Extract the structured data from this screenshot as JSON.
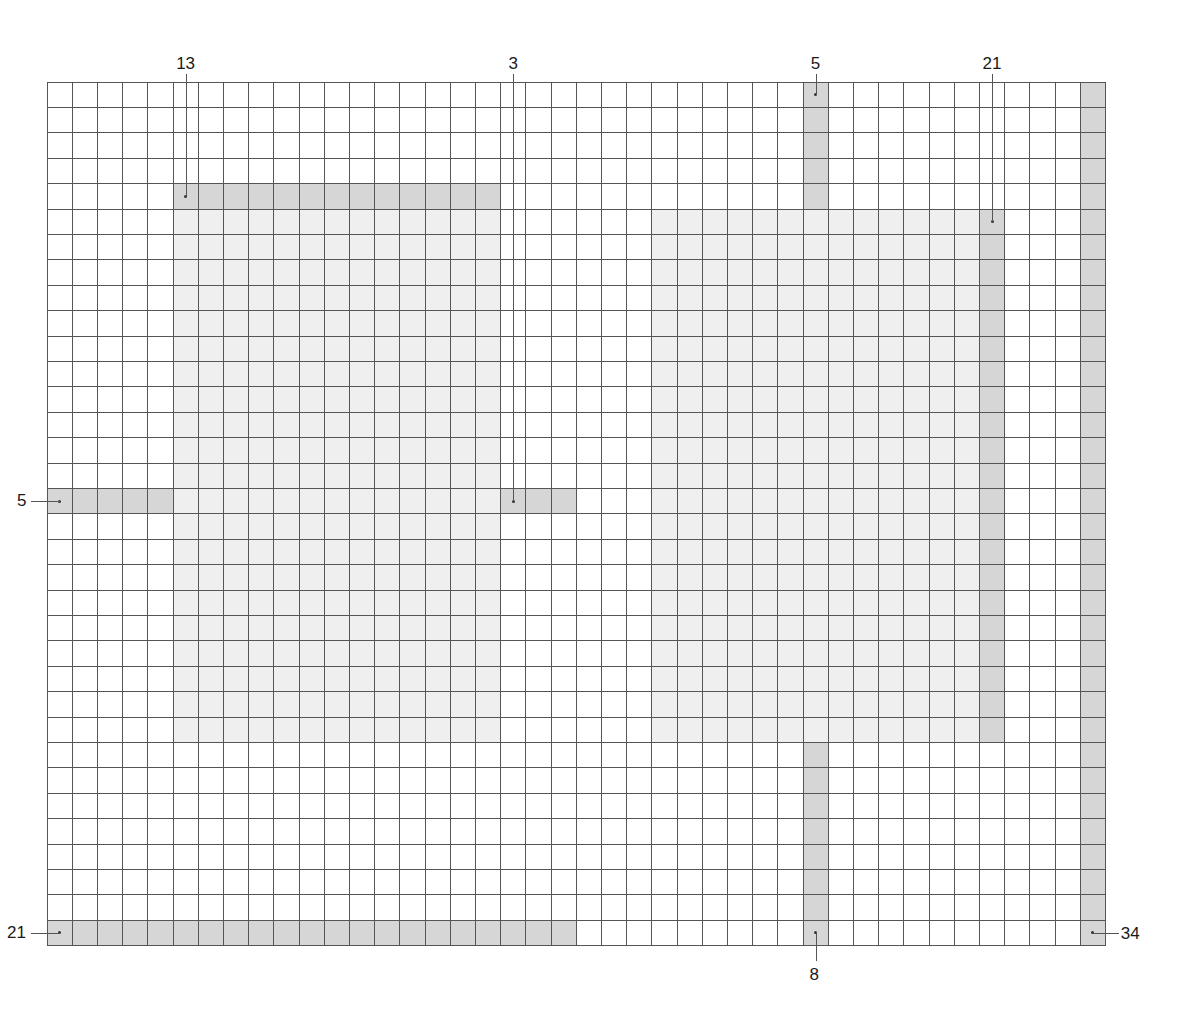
{
  "diagram": {
    "title": "",
    "grid": {
      "cols": 42,
      "rows": 34,
      "origin_x": 47,
      "origin_y": 82,
      "cell_w": 25.2,
      "cell_h": 25.4,
      "divider_col": 21,
      "line_color": "#555555"
    },
    "colors": {
      "light_fill": "#efefef",
      "dark_fill": "#d6d6d6",
      "background": "#ffffff"
    },
    "light_regions": [
      {
        "name": "left-square-region",
        "col": 5,
        "row": 5,
        "w": 13,
        "h": 21
      },
      {
        "name": "right-square-region",
        "col": 24,
        "row": 5,
        "w": 13,
        "h": 21
      }
    ],
    "strips": [
      {
        "name": "strip-13",
        "col": 5,
        "row": 4,
        "w": 13,
        "h": 1,
        "label": "13",
        "label_side": "top",
        "dot_col": 5,
        "dot_row": 4
      },
      {
        "name": "strip-3",
        "col": 18,
        "row": 16,
        "w": 3,
        "h": 1,
        "label": "3",
        "label_side": "top",
        "dot_col": 18,
        "dot_row": 16
      },
      {
        "name": "strip-5-left",
        "col": 0,
        "row": 16,
        "w": 5,
        "h": 1,
        "label": "5",
        "label_side": "left",
        "dot_col": 0,
        "dot_row": 16
      },
      {
        "name": "strip-21-bottom",
        "col": 0,
        "row": 33,
        "w": 21,
        "h": 1,
        "label": "21",
        "label_side": "left",
        "dot_col": 0,
        "dot_row": 33
      },
      {
        "name": "strip-5-top",
        "col": 30,
        "row": 0,
        "w": 1,
        "h": 5,
        "label": "5",
        "label_side": "top",
        "dot_col": 30,
        "dot_row": 0
      },
      {
        "name": "strip-21-right",
        "col": 37,
        "row": 5,
        "w": 1,
        "h": 21,
        "label": "21",
        "label_side": "top",
        "dot_col": 37,
        "dot_row": 5
      },
      {
        "name": "strip-8",
        "col": 30,
        "row": 26,
        "w": 1,
        "h": 8,
        "label": "8",
        "label_side": "bottom",
        "dot_col": 30,
        "dot_row": 33
      },
      {
        "name": "strip-34",
        "col": 41,
        "row": 0,
        "w": 1,
        "h": 34,
        "label": "34",
        "label_side": "right",
        "dot_col": 41,
        "dot_row": 33
      }
    ]
  }
}
